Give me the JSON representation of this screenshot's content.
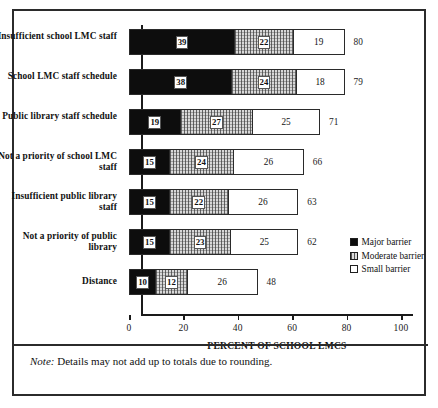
{
  "figure": {
    "note_prefix": "Note:",
    "note_text": " Details may not add up to totals due to rounding."
  },
  "chart_data": {
    "type": "bar",
    "orientation": "horizontal",
    "stacked": true,
    "title": "",
    "xlabel": "PERCENT OF SCHOOL LMCS",
    "ylabel": "",
    "xlim": [
      0,
      100
    ],
    "xticks": [
      0,
      20,
      40,
      60,
      80,
      100
    ],
    "xticklabels": [
      "0",
      "20",
      "40",
      "60",
      "80",
      "100"
    ],
    "grid": false,
    "legend_position": "right",
    "categories": [
      "Insufficient school LMC staff",
      "School LMC staff schedule",
      "Public library staff schedule",
      "Not a priority of school LMC staff",
      "Insufficient public library staff",
      "Not a priority of public library",
      "Distance"
    ],
    "series": [
      {
        "name": "Major barrier",
        "values": [
          39,
          38,
          19,
          15,
          15,
          15,
          10
        ]
      },
      {
        "name": "Moderate barrier",
        "values": [
          22,
          24,
          27,
          24,
          22,
          23,
          12
        ]
      },
      {
        "name": "Small barrier",
        "values": [
          19,
          18,
          25,
          26,
          26,
          25,
          26
        ]
      }
    ],
    "totals": [
      80,
      79,
      71,
      66,
      63,
      62,
      48
    ],
    "colors": {
      "major": "#0d0d0d",
      "moderate": "#d8d8d8",
      "small": "#ffffff"
    }
  }
}
